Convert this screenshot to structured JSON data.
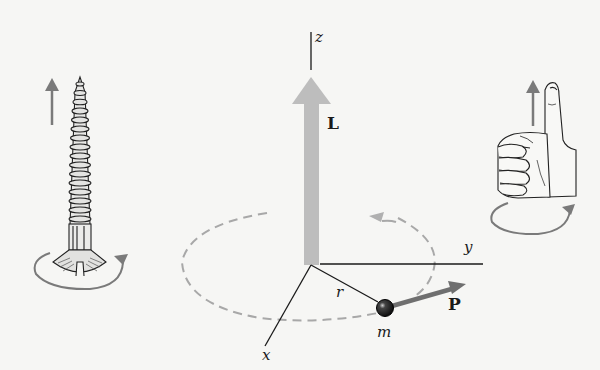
{
  "figure": {
    "labels": {
      "z_axis": "z",
      "y_axis": "y",
      "x_axis": "x",
      "angular_momentum": "L",
      "radius": "r",
      "mass": "m",
      "momentum": "P"
    },
    "colors": {
      "background": "#f6f6f4",
      "L_arrow": "#bdbdbd",
      "P_arrow": "#6f6f6f",
      "orbit": "#a8a8a8",
      "rotation_arrows": "#7a7a7a",
      "ink": "#1a1a1a"
    },
    "illustrations": [
      "screw-advancing-upward",
      "right-hand-thumbs-up"
    ]
  }
}
